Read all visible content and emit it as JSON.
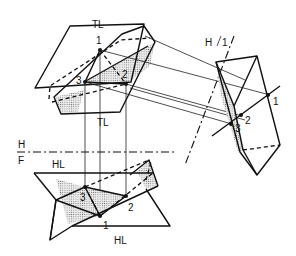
{
  "figure": {
    "type": "descriptive-geometry-construction",
    "colors": {
      "ink": "#111111",
      "paper": "#ffffff",
      "shade": "#cfcfcf"
    }
  },
  "labels": {
    "tl_top": "TL",
    "tl_mid": "TL",
    "hl_front": "HL",
    "hl_bottom": "HL",
    "fold_hf_h": "H",
    "fold_hf_f": "F",
    "fold_h1_h": "H",
    "fold_h1_1": "1"
  },
  "points": {
    "top_view": {
      "p1": "1",
      "p2": "2",
      "p3": "3"
    },
    "aux_view": {
      "p1": "1",
      "p2": "2",
      "p3": "3"
    },
    "front_view": {
      "p1": "1",
      "p2": "2",
      "p3": "3"
    }
  }
}
